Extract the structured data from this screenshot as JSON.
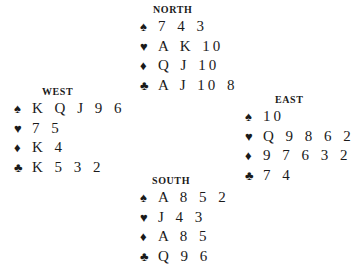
{
  "suits": {
    "spades": "♠",
    "hearts": "♥",
    "diamonds": "♦",
    "clubs": "♣"
  },
  "hands": {
    "north": {
      "title": "NORTH",
      "spades": "7 4 3",
      "hearts": "A K 10",
      "diamonds": "Q J 10",
      "clubs": "A J 10 8"
    },
    "west": {
      "title": "WEST",
      "spades": "K Q J 9 6",
      "hearts": "7 5",
      "diamonds": "K 4",
      "clubs": "K 5 3 2"
    },
    "east": {
      "title": "EAST",
      "spades": "10",
      "hearts": "Q 9 8 6 2",
      "diamonds": "9 7 6 3 2",
      "clubs": "7 4"
    },
    "south": {
      "title": "SOUTH",
      "spades": "A 8 5 2",
      "hearts": "J 4 3",
      "diamonds": "A 8 5",
      "clubs": "Q 9 6"
    }
  }
}
